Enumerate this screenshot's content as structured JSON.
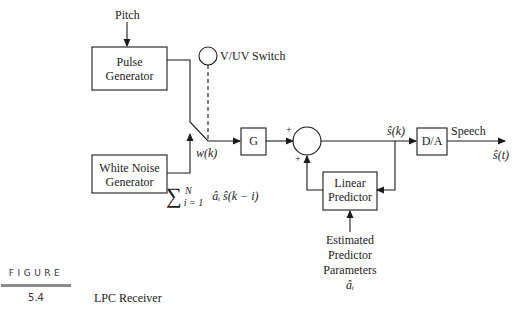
{
  "figure": {
    "label": "FIGURE",
    "number": "5.4",
    "caption": "LPC Receiver"
  },
  "blocks": {
    "pulse_generator": {
      "line1": "Pulse",
      "line2": "Generator"
    },
    "white_noise_generator": {
      "line1": "White Noise",
      "line2": "Generator"
    },
    "gain": {
      "label": "G"
    },
    "linear_predictor": {
      "line1": "Linear",
      "line2": "Predictor"
    },
    "dac": {
      "label": "D/A"
    }
  },
  "labels": {
    "pitch": "Pitch",
    "switch": "V/UV Switch",
    "excitation": "w(k)",
    "sum_plus_top": "+",
    "sum_plus_bottom": "+",
    "s_hat_k": "ŝ(k)",
    "speech": "Speech",
    "s_hat_t": "ŝ(t)",
    "prediction_sum_sigma": "∑",
    "prediction_sum_upper": "N",
    "prediction_sum_lower": "i = 1",
    "prediction_sum_term": "âᵢ ŝ(k − i)",
    "params_line1": "Estimated",
    "params_line2": "Predictor",
    "params_line3": "Parameters",
    "params_line4": "âᵢ"
  },
  "colors": {
    "stroke": "#1a1a1a",
    "figure_bar": "#8a8a8a"
  }
}
